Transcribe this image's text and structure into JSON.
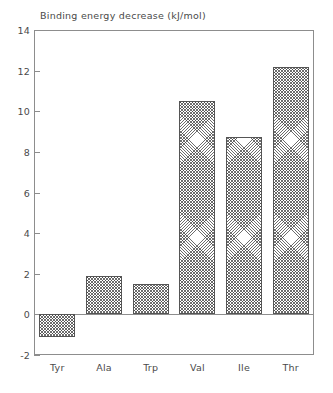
{
  "chart_data": {
    "type": "bar",
    "title": "Binding energy decrease (kJ/mol)",
    "xlabel": "",
    "ylabel": "",
    "categories": [
      "Tyr",
      "Ala",
      "Trp",
      "Val",
      "Ile",
      "Thr"
    ],
    "values": [
      -1.1,
      1.9,
      1.5,
      10.5,
      8.75,
      12.2
    ],
    "ylim": [
      -2,
      14
    ],
    "ytick_labels": [
      "14",
      "12",
      "10",
      "8",
      "6",
      "4",
      "2",
      "0",
      "-2"
    ],
    "ytick_values": [
      14,
      12,
      10,
      8,
      6,
      4,
      2,
      0,
      -2
    ],
    "grid": false,
    "legend": "none",
    "bar_fill": "crosshatch",
    "colors": {
      "axis": "#8d8d8d",
      "text": "#4a4a4a",
      "bar_edge": "#555555",
      "background": "#ffffff"
    }
  }
}
